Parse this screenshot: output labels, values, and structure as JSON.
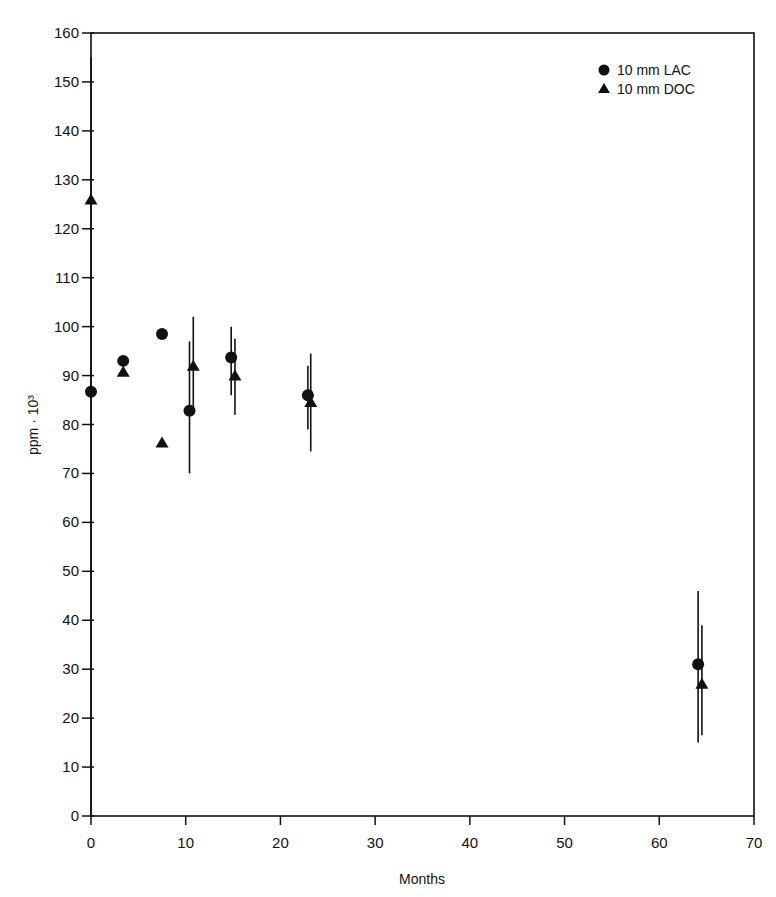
{
  "chart_data": {
    "type": "scatter",
    "title": "",
    "xlabel": "Months",
    "ylabel": "ppm · 10³",
    "xlim": [
      0,
      70
    ],
    "ylim": [
      0,
      160
    ],
    "xticks": [
      0,
      10,
      20,
      30,
      40,
      50,
      60,
      70
    ],
    "yticks": [
      0,
      10,
      20,
      30,
      40,
      50,
      60,
      70,
      80,
      90,
      100,
      110,
      120,
      130,
      140,
      150,
      160
    ],
    "grid": false,
    "legend_position": "upper right",
    "series": [
      {
        "name": "10 mm LAC",
        "marker": "circle",
        "points": [
          {
            "x": 0,
            "y": 86.7,
            "err_low": null,
            "err_high": null
          },
          {
            "x": 3.4,
            "y": 93.0,
            "err_low": null,
            "err_high": null
          },
          {
            "x": 7.5,
            "y": 98.5,
            "err_low": null,
            "err_high": null
          },
          {
            "x": 10.4,
            "y": 82.8,
            "err_low": 70.0,
            "err_high": 97.0
          },
          {
            "x": 14.8,
            "y": 93.7,
            "err_low": 86.0,
            "err_high": 100.0
          },
          {
            "x": 22.9,
            "y": 86.0,
            "err_low": 79.0,
            "err_high": 92.0
          },
          {
            "x": 64.1,
            "y": 31.0,
            "err_low": 15.0,
            "err_high": 46.0
          }
        ]
      },
      {
        "name": "10 mm DOC",
        "marker": "triangle",
        "points": [
          {
            "x": 0,
            "y": 126.0,
            "err_low": 0.0,
            "err_high": 155.0
          },
          {
            "x": 3.4,
            "y": 90.8,
            "err_low": null,
            "err_high": null
          },
          {
            "x": 7.5,
            "y": 76.3,
            "err_low": null,
            "err_high": null
          },
          {
            "x": 10.8,
            "y": 92.0,
            "err_low": 83.0,
            "err_high": 102.0
          },
          {
            "x": 15.2,
            "y": 90.0,
            "err_low": 82.0,
            "err_high": 97.5
          },
          {
            "x": 23.2,
            "y": 84.6,
            "err_low": 74.5,
            "err_high": 94.5
          },
          {
            "x": 64.5,
            "y": 27.0,
            "err_low": 16.5,
            "err_high": 39.0
          }
        ]
      }
    ]
  },
  "legend": {
    "items": [
      {
        "label": "10 mm LAC",
        "icon": "circle-marker-icon"
      },
      {
        "label": "10 mm DOC",
        "icon": "triangle-marker-icon"
      }
    ]
  },
  "colors": {
    "ink": "#111111",
    "background": "#ffffff"
  }
}
